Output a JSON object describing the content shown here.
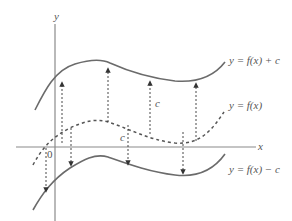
{
  "diagram": {
    "axes": {
      "x_label": "x",
      "y_label": "y",
      "origin_label": "0"
    },
    "curves": [
      {
        "name": "shifted-up",
        "label": "y = f(x) + c",
        "style": "solid"
      },
      {
        "name": "original",
        "label": "y = f(x)",
        "style": "dashed"
      },
      {
        "name": "shifted-down",
        "label": "y = f(x) − c",
        "style": "solid"
      }
    ],
    "shift_labels": {
      "up": "c",
      "down": "c"
    },
    "colors": {
      "curve": "#6b6b6b",
      "axis": "#8a8a8a",
      "dashed": "#555555",
      "text": "#555555"
    }
  }
}
